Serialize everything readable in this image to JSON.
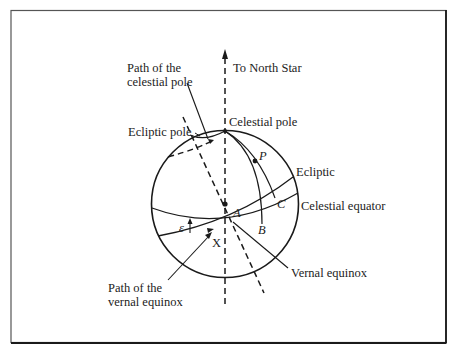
{
  "figure": {
    "type": "celestial-sphere-precession-diagram",
    "colors": {
      "ink": "#1a1a1a",
      "frame": "#2a2a2a",
      "background": "#ffffff"
    },
    "labels": {
      "north_star": "To North Star",
      "path_celestial_pole_line1": "Path of the",
      "path_celestial_pole_line2": "celestial pole",
      "celestial_pole": "Celestial pole",
      "ecliptic_pole": "Ecliptic pole",
      "point_p": "P",
      "ecliptic": "Ecliptic",
      "point_c": "C",
      "celestial_equator": "Celestial equator",
      "point_a": "A",
      "point_b": "B",
      "epsilon": "ε",
      "point_x": "X",
      "path_vernal_equinox_line1": "Path of the",
      "path_vernal_equinox_line2": "vernal equinox",
      "vernal_equinox": "Vernal equinox"
    }
  }
}
